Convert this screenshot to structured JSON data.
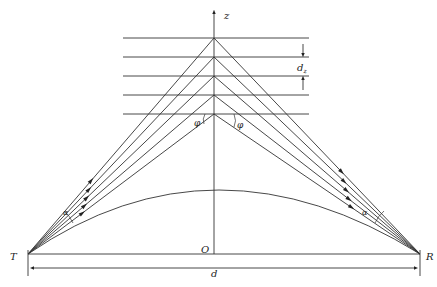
{
  "labels": {
    "z_axis": "z",
    "origin": "O",
    "transmitter": "T",
    "receiver": "R",
    "distance": "d",
    "layer_spacing": "d",
    "layer_spacing_sub": "z",
    "angle_phi_left": "φ",
    "angle_phi_right": "φ",
    "angle_alpha_left": "α",
    "angle_alpha_right": "α"
  },
  "geometry": {
    "T": [
      28,
      254
    ],
    "R": [
      420,
      254
    ],
    "z_axis_x": 214,
    "z_axis_top": 8,
    "z_axis_bottom": 254,
    "layers_y": [
      38,
      57,
      76,
      95,
      114
    ],
    "layer_x_start": 123,
    "layer_x_end": 309,
    "arc_peak_y": 190,
    "distance_arrow_y": 268
  },
  "colors": {
    "line": "#333333",
    "background": "#ffffff"
  }
}
